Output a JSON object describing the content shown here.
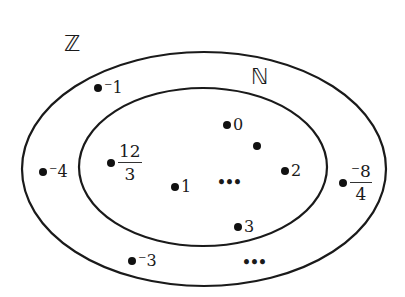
{
  "diagram": {
    "type": "venn-nested-sets",
    "outer_set": {
      "label": "ℤ",
      "name": "integers",
      "stroke": "#1a1a1a"
    },
    "inner_set": {
      "label": "ℕ",
      "name": "natural-numbers",
      "stroke": "#1a1a1a"
    },
    "outer_only_elements": [
      {
        "id": "neg1",
        "text": "⁻1"
      },
      {
        "id": "neg4",
        "text": "⁻4"
      },
      {
        "id": "neg3",
        "text": "⁻3"
      },
      {
        "id": "neg8over4",
        "numerator": "⁻8",
        "denominator": "4"
      },
      {
        "id": "outer-ellipsis",
        "text": "•••"
      }
    ],
    "inner_elements": [
      {
        "id": "twelve-over-three",
        "numerator": "12",
        "denominator": "3"
      },
      {
        "id": "zero",
        "text": "0"
      },
      {
        "id": "unlabeled",
        "text": ""
      },
      {
        "id": "one",
        "text": "1"
      },
      {
        "id": "two",
        "text": "2"
      },
      {
        "id": "three",
        "text": "3"
      },
      {
        "id": "inner-ellipsis",
        "text": "•••"
      }
    ]
  }
}
